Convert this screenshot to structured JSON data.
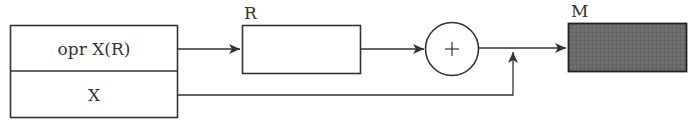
{
  "diagram": {
    "instruction_box": {
      "opcode_field": "opr  X(R)",
      "address_field": "X"
    },
    "register": {
      "label": "R"
    },
    "adder": {
      "symbol": "+"
    },
    "memory": {
      "label": "M",
      "fill_color": "#6b6b6b"
    },
    "colors": {
      "stroke": "#333333",
      "background": "#ffffff"
    }
  }
}
